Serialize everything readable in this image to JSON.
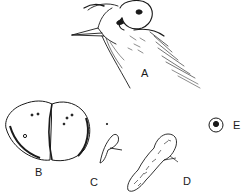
{
  "figure": {
    "panels": [
      {
        "id": "A",
        "label": "A",
        "subject": "bird-head-with-parasite"
      },
      {
        "id": "B",
        "label": "B",
        "subject": "bilobed-body"
      },
      {
        "id": "C",
        "label": "C",
        "subject": "small-curved-form"
      },
      {
        "id": "D",
        "label": "D",
        "subject": "elongated-textured-form"
      },
      {
        "id": "E",
        "label": "E",
        "subject": "circular-spot"
      }
    ],
    "colors": {
      "ink": "#1a1a1a",
      "background": "#ffffff"
    }
  }
}
